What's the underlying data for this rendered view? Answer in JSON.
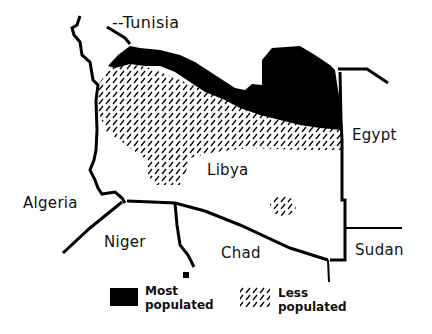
{
  "map": {
    "title": "Libya population distribution",
    "colors": {
      "ink": "#000000",
      "background": "#ffffff"
    },
    "countries": {
      "tunisia": "--Tunisia",
      "egypt": "Egypt",
      "libya": "Libya",
      "algeria": "Algeria",
      "niger": "Niger",
      "chad": "Chad",
      "sudan": "Sudan"
    },
    "legend": {
      "most": {
        "line1": "Most",
        "line2": "populated",
        "pattern": "solid-black"
      },
      "less": {
        "line1": "Less",
        "line2": "populated",
        "pattern": "diagonal-hatch"
      }
    }
  }
}
